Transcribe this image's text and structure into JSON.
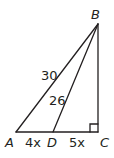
{
  "diagram": {
    "type": "geometry-triangle",
    "vertices": [
      {
        "id": "A",
        "label": "A",
        "x": 16,
        "y": 132
      },
      {
        "id": "B",
        "label": "B",
        "x": 98,
        "y": 24
      },
      {
        "id": "C",
        "label": "C",
        "x": 98,
        "y": 132
      },
      {
        "id": "D",
        "label": "D",
        "x": 53,
        "y": 132
      }
    ],
    "segments": [
      {
        "from": "A",
        "to": "B",
        "label": "30"
      },
      {
        "from": "D",
        "to": "B",
        "label": "26"
      },
      {
        "from": "A",
        "to": "D",
        "label": "4x"
      },
      {
        "from": "D",
        "to": "C",
        "label": "5x"
      },
      {
        "from": "B",
        "to": "C",
        "label": ""
      }
    ],
    "right_angle_at": "C",
    "labels": {
      "A": "A",
      "B": "B",
      "C": "C",
      "D": "D",
      "AB": "30",
      "DB": "26",
      "AD": "4x",
      "DC": "5x"
    },
    "stroke_color": "#231f20"
  }
}
